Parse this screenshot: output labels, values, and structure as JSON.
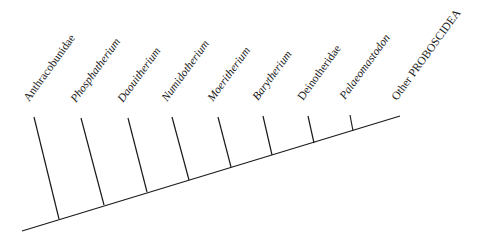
{
  "diagram": {
    "type": "cladogram",
    "line_color": "#1a1a1a",
    "stem": {
      "x1": 22,
      "y1": 231,
      "x2": 400,
      "y2": 116
    },
    "taxa": [
      {
        "name": "Anthracobunidae",
        "italic": false,
        "top": [
          34,
          117
        ],
        "base": [
          59,
          219
        ],
        "label_pos": [
          31,
          103
        ]
      },
      {
        "name": "Phosphatherium",
        "italic": true,
        "top": [
          81,
          118
        ],
        "base": [
          104,
          205
        ],
        "label_pos": [
          78,
          104
        ]
      },
      {
        "name": "Daouitherium",
        "italic": true,
        "top": [
          128,
          118
        ],
        "base": [
          147,
          192
        ],
        "label_pos": [
          125,
          104
        ]
      },
      {
        "name": "Numidotherium",
        "italic": true,
        "top": [
          172,
          117
        ],
        "base": [
          189,
          180
        ],
        "label_pos": [
          169,
          103
        ]
      },
      {
        "name": "Moeritherium",
        "italic": true,
        "top": [
          218,
          117
        ],
        "base": [
          231,
          167
        ],
        "label_pos": [
          215,
          103
        ]
      },
      {
        "name": "Barytherium",
        "italic": true,
        "top": [
          263,
          116
        ],
        "base": [
          272,
          155
        ],
        "label_pos": [
          260,
          102
        ]
      },
      {
        "name": "Deinotheridae",
        "italic": false,
        "top": [
          308,
          116
        ],
        "base": [
          314,
          143
        ],
        "label_pos": [
          305,
          102
        ]
      },
      {
        "name": "Palaeomastodon",
        "italic": true,
        "top": [
          350,
          115
        ],
        "base": [
          353,
          131
        ],
        "label_pos": [
          347,
          101
        ]
      },
      {
        "name": "Other PROBOSCIDEA",
        "italic": false,
        "top": null,
        "base": [
          400,
          116
        ],
        "label_pos": [
          399,
          102
        ]
      }
    ]
  }
}
